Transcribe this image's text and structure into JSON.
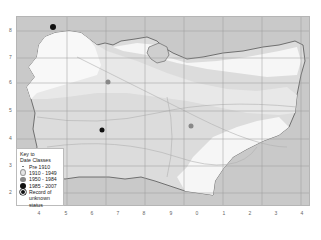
{
  "map": {
    "x_axis_labels": [
      "4",
      "5",
      "6",
      "7",
      "8",
      "9",
      "0",
      "1",
      "2",
      "3",
      "4"
    ],
    "y_axis_labels": [
      "8",
      "7",
      "6",
      "5",
      "4",
      "3",
      "2"
    ],
    "colors": {
      "sea": "#c9c9c9",
      "pre1910": "#f7f7f7",
      "c1910_1949": "#e6e6e6",
      "c1950_1984": "#d9d9d9",
      "grid": "#9a9a9a",
      "coast": "#555555",
      "record_1950_1984": "#888888",
      "record_1985_2007": "#111111"
    },
    "records": [
      {
        "class": "1985 - 2007",
        "x": 52,
        "y": 10
      },
      {
        "class": "1950 - 1984",
        "x": 91,
        "y": 65
      },
      {
        "class": "1985 - 2007",
        "x": 85,
        "y": 113
      },
      {
        "class": "1950 - 1984",
        "x": 174,
        "y": 109
      }
    ]
  },
  "legend": {
    "title_line1": "Key to",
    "title_line2": "Date Classes",
    "items": [
      {
        "label": "Pre 1910",
        "symbol": "small-dot"
      },
      {
        "label": "1910 - 1949",
        "symbol": "light-circle"
      },
      {
        "label": "1950 - 1984",
        "symbol": "grey-circle"
      },
      {
        "label": "1985 - 2007",
        "symbol": "black-circle"
      },
      {
        "label": "Record of",
        "symbol": "black-dot-ring"
      }
    ],
    "last_line": "unknown status"
  }
}
